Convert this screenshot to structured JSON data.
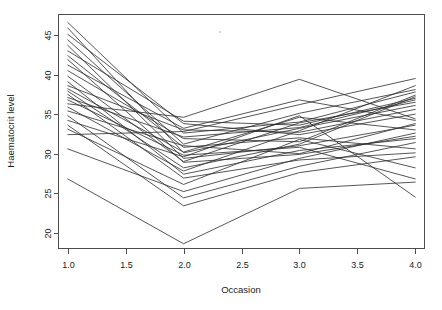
{
  "chart_data": {
    "type": "line",
    "title": "",
    "subtitle": "",
    "xlabel": "Occasion",
    "ylabel": "Haematocrit level",
    "grid": false,
    "legend": false,
    "legend_position": "none",
    "x": [
      1,
      2,
      3,
      4
    ],
    "xlim": [
      0.92,
      4.08
    ],
    "ylim": [
      18.0,
      47.6
    ],
    "xticks": [
      1.0,
      1.5,
      2.0,
      2.5,
      3.0,
      3.5,
      4.0
    ],
    "xtick_labels": [
      "1.0",
      "1.5",
      "2.0",
      "2.5",
      "3.0",
      "3.5",
      "4.0"
    ],
    "yticks": [
      20,
      25,
      30,
      35,
      40,
      45
    ],
    "ytick_labels": [
      "20",
      "25",
      "30",
      "35",
      "40",
      "45"
    ],
    "line_color": "#2b2b2b",
    "background_color": "#ffffff",
    "series": [
      {
        "name": "subject-01",
        "values": [
          46.6,
          32.6,
          34.0,
          37.8
        ]
      },
      {
        "name": "subject-02",
        "values": [
          45.9,
          30.1,
          33.2,
          36.1
        ]
      },
      {
        "name": "subject-03",
        "values": [
          45.1,
          33.8,
          32.4,
          35.0
        ]
      },
      {
        "name": "subject-04",
        "values": [
          44.4,
          31.2,
          35.1,
          38.1
        ]
      },
      {
        "name": "subject-05",
        "values": [
          43.7,
          29.4,
          31.0,
          33.6
        ]
      },
      {
        "name": "subject-06",
        "values": [
          43.0,
          34.1,
          33.6,
          37.0
        ]
      },
      {
        "name": "subject-07",
        "values": [
          42.4,
          30.8,
          32.0,
          30.6
        ]
      },
      {
        "name": "subject-08",
        "values": [
          41.9,
          28.9,
          29.9,
          32.2
        ]
      },
      {
        "name": "subject-09",
        "values": [
          41.2,
          33.2,
          36.8,
          34.2
        ]
      },
      {
        "name": "subject-10",
        "values": [
          40.5,
          31.9,
          31.5,
          37.4
        ]
      },
      {
        "name": "subject-11",
        "values": [
          39.8,
          29.0,
          33.9,
          36.5
        ]
      },
      {
        "name": "subject-12",
        "values": [
          39.1,
          27.4,
          30.4,
          31.9
        ]
      },
      {
        "name": "subject-13",
        "values": [
          38.6,
          33.0,
          32.7,
          35.6
        ]
      },
      {
        "name": "subject-14",
        "values": [
          38.2,
          30.2,
          34.6,
          33.0
        ]
      },
      {
        "name": "subject-15",
        "values": [
          37.9,
          28.2,
          31.2,
          37.2
        ]
      },
      {
        "name": "subject-16",
        "values": [
          37.5,
          26.9,
          29.2,
          30.1
        ]
      },
      {
        "name": "subject-17",
        "values": [
          37.1,
          32.1,
          33.3,
          36.8
        ]
      },
      {
        "name": "subject-18",
        "values": [
          36.8,
          29.8,
          30.8,
          26.8
        ]
      },
      {
        "name": "subject-19",
        "values": [
          36.3,
          34.6,
          39.4,
          34.4
        ]
      },
      {
        "name": "subject-20",
        "values": [
          35.9,
          27.8,
          32.9,
          38.6
        ]
      },
      {
        "name": "subject-21",
        "values": [
          35.4,
          31.0,
          30.0,
          33.8
        ]
      },
      {
        "name": "subject-22",
        "values": [
          34.8,
          24.4,
          28.4,
          31.4
        ]
      },
      {
        "name": "subject-23",
        "values": [
          34.2,
          29.6,
          34.8,
          24.5
        ]
      },
      {
        "name": "subject-24",
        "values": [
          33.6,
          23.4,
          27.6,
          29.6
        ]
      },
      {
        "name": "subject-25",
        "values": [
          33.1,
          26.1,
          31.8,
          28.2
        ]
      },
      {
        "name": "subject-26",
        "values": [
          32.4,
          32.8,
          36.2,
          39.5
        ]
      },
      {
        "name": "subject-27",
        "values": [
          30.6,
          25.2,
          29.4,
          32.6
        ]
      },
      {
        "name": "subject-28",
        "values": [
          26.8,
          18.6,
          25.6,
          26.4
        ]
      }
    ]
  }
}
